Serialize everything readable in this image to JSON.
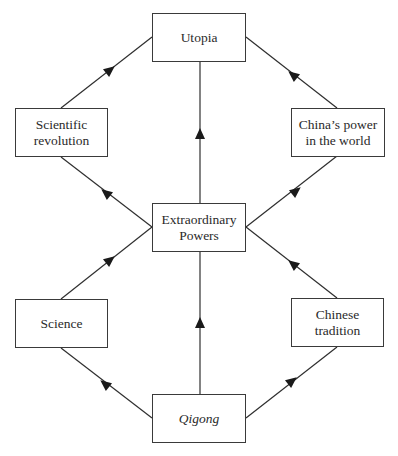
{
  "diagram": {
    "type": "flow-diagram",
    "nodes": [
      {
        "id": "utopia",
        "label": "Utopia",
        "italic": false
      },
      {
        "id": "scientific_revolution",
        "label_lines": [
          "Scientific",
          "revolution"
        ],
        "italic": false
      },
      {
        "id": "chinas_power",
        "label_lines": [
          "China’s power",
          "in the world"
        ],
        "italic": false
      },
      {
        "id": "extraordinary_powers",
        "label_lines": [
          "Extraordinary",
          "Powers"
        ],
        "italic": false
      },
      {
        "id": "science",
        "label": "Science",
        "italic": false
      },
      {
        "id": "chinese_tradition",
        "label_lines": [
          "Chinese",
          "tradition"
        ],
        "italic": false
      },
      {
        "id": "qigong",
        "label": "Qigong",
        "italic": true
      }
    ],
    "edges": [
      {
        "from": "qigong",
        "to": "science"
      },
      {
        "from": "qigong",
        "to": "extraordinary_powers"
      },
      {
        "from": "qigong",
        "to": "chinese_tradition"
      },
      {
        "from": "science",
        "to": "extraordinary_powers"
      },
      {
        "from": "chinese_tradition",
        "to": "extraordinary_powers"
      },
      {
        "from": "extraordinary_powers",
        "to": "scientific_revolution"
      },
      {
        "from": "extraordinary_powers",
        "to": "utopia"
      },
      {
        "from": "extraordinary_powers",
        "to": "chinas_power"
      },
      {
        "from": "scientific_revolution",
        "to": "utopia"
      },
      {
        "from": "chinas_power",
        "to": "utopia"
      }
    ]
  },
  "labels": {
    "utopia": "Utopia",
    "scientific_revolution_1": "Scientific",
    "scientific_revolution_2": "revolution",
    "chinas_power_1": "China’s power",
    "chinas_power_2": "in the world",
    "extraordinary_powers_1": "Extraordinary",
    "extraordinary_powers_2": "Powers",
    "science": "Science",
    "chinese_tradition_1": "Chinese",
    "chinese_tradition_2": "tradition",
    "qigong": "Qigong"
  },
  "colors": {
    "line": "#2f2f2f",
    "box_border": "#3a3a3a",
    "background": "#ffffff"
  }
}
